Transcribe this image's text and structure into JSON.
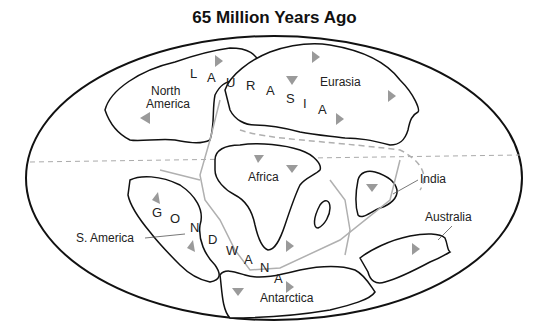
{
  "title": "65 Million Years Ago",
  "labels": {
    "north_america": [
      "North",
      "America"
    ],
    "eurasia": "Eurasia",
    "africa": "Africa",
    "india": "India",
    "australia": "Australia",
    "south_america": "S. America",
    "antarctica": "Antarctica"
  },
  "supercontinents": {
    "laurasia": [
      "L",
      "A",
      "U",
      "R",
      "A",
      "S",
      "I",
      "A"
    ],
    "gondwana": [
      "G",
      "O",
      "N",
      "D",
      "W",
      "A",
      "N",
      "A"
    ]
  },
  "colors": {
    "outline": "#111111",
    "ridge": "#b0b0b0",
    "arrow": "#9a9a9a",
    "equator": "#aaaaaa"
  }
}
